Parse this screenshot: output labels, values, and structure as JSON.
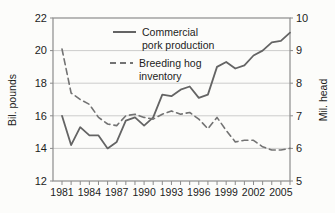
{
  "colors": {
    "background": "#fcfcfa",
    "pork_line": "#646464",
    "inventory_line": "#737373",
    "grid": "#c6c6c6",
    "axis": "#8c8c8c",
    "text": "#1c1c1c"
  },
  "chart_data": {
    "type": "line",
    "title": "",
    "x": [
      1981,
      1982,
      1983,
      1984,
      1985,
      1986,
      1987,
      1988,
      1989,
      1990,
      1991,
      1992,
      1993,
      1994,
      1995,
      1996,
      1997,
      1998,
      1999,
      2000,
      2001,
      2002,
      2003,
      2004,
      2005,
      2006
    ],
    "series": [
      {
        "name": "Commercial pork production",
        "axis": "left",
        "style": "solid",
        "values": [
          16.0,
          14.2,
          15.3,
          14.8,
          14.8,
          14.0,
          14.4,
          15.7,
          15.9,
          15.4,
          15.9,
          17.3,
          17.2,
          17.6,
          17.8,
          17.1,
          17.3,
          19.0,
          19.3,
          18.9,
          19.1,
          19.7,
          20.0,
          20.5,
          20.6,
          21.1
        ]
      },
      {
        "name": "Breeding hog inventory",
        "axis": "right",
        "style": "dashed",
        "values": [
          9.05,
          7.7,
          7.5,
          7.35,
          6.95,
          6.75,
          6.7,
          7.0,
          7.05,
          6.95,
          6.9,
          7.05,
          7.15,
          7.05,
          7.1,
          6.9,
          6.6,
          6.95,
          6.55,
          6.2,
          6.25,
          6.25,
          6.05,
          5.95,
          5.95,
          6.0
        ]
      }
    ],
    "left_axis": {
      "label": "Bil. pounds",
      "min": 12,
      "max": 22,
      "ticks": [
        12,
        14,
        16,
        18,
        20,
        22
      ]
    },
    "right_axis": {
      "label": "Mil. head",
      "min": 5,
      "max": 10,
      "ticks": [
        5,
        6,
        7,
        8,
        9,
        10
      ]
    },
    "x_tick_labels": [
      1981,
      1984,
      1987,
      1990,
      1993,
      1996,
      1999,
      2002,
      2005
    ],
    "grid": "horizontal",
    "legend": {
      "position": "top-center-inside",
      "items": [
        {
          "sample": "solid-line",
          "label_line1": "Commercial",
          "label_line2": "pork production"
        },
        {
          "sample": "dashed-line",
          "label_line1": "Breeding hog",
          "label_line2": "inventory"
        }
      ]
    }
  }
}
